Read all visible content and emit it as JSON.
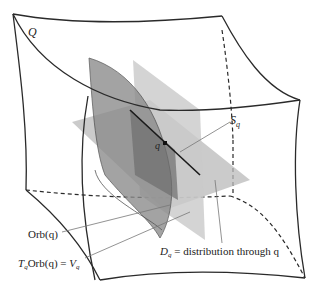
{
  "diagram": {
    "labels": {
      "manifold": "Q",
      "point": "q",
      "slice": "S",
      "slice_sub": "q",
      "orbit": "Orb(q)",
      "tangent_T": "T",
      "tangent_sub": "q",
      "tangent_rest": "Orb(q) = ",
      "tangent_V": "V",
      "tangent_V_sub": "q",
      "distribution_D": "D",
      "distribution_sub": "q",
      "distribution_rest": " = distribution through q"
    },
    "colors": {
      "line": "#2a2a2a",
      "plane_light": "#c8c8c8",
      "plane_mid": "#9a9a9a",
      "plane_dark": "#707070",
      "leader": "#777777"
    }
  }
}
